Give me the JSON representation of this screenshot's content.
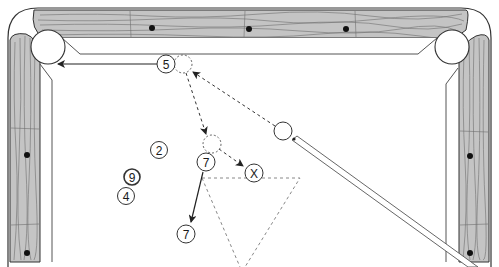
{
  "diagram": {
    "type": "pool-shot-diagram",
    "colors": {
      "wood": "#c4c4c4",
      "wood_grain": "#6e6e6e",
      "outline": "#333333",
      "diamond": "#111111",
      "path_dashed": "#333333",
      "rack_dashed": "#888888",
      "cloth": "#ffffff"
    },
    "balls": [
      {
        "id": "ball-5",
        "label": "5"
      },
      {
        "id": "ball-2",
        "label": "2"
      },
      {
        "id": "ball-9",
        "label": "9"
      },
      {
        "id": "ball-4",
        "label": "4"
      },
      {
        "id": "ball-7-start",
        "label": "7"
      },
      {
        "id": "ball-7-end",
        "label": "7"
      },
      {
        "id": "target-x",
        "label": "X"
      }
    ],
    "cue_ball": {
      "label": ""
    },
    "ghost_balls": [
      {
        "id": "ghost-at-5"
      },
      {
        "id": "ghost-at-7"
      }
    ],
    "paths": [
      {
        "from": "cue-ball",
        "to": "ghost-at-5",
        "style": "dashed-arrow"
      },
      {
        "from": "ghost-at-5",
        "to": "ghost-at-7",
        "style": "dashed-arrow"
      },
      {
        "from": "ghost-at-7",
        "to": "target-x",
        "style": "dashed-arrow"
      },
      {
        "from": "ball-5",
        "to": "top-left-pocket",
        "style": "solid-arrow"
      },
      {
        "from": "ball-7-start",
        "to": "ball-7-end",
        "style": "solid-arrow"
      }
    ],
    "rack_outline": {
      "style": "dashed-triangle"
    },
    "rail_diamonds": {
      "top": 3,
      "left": 2,
      "right": 2
    }
  }
}
